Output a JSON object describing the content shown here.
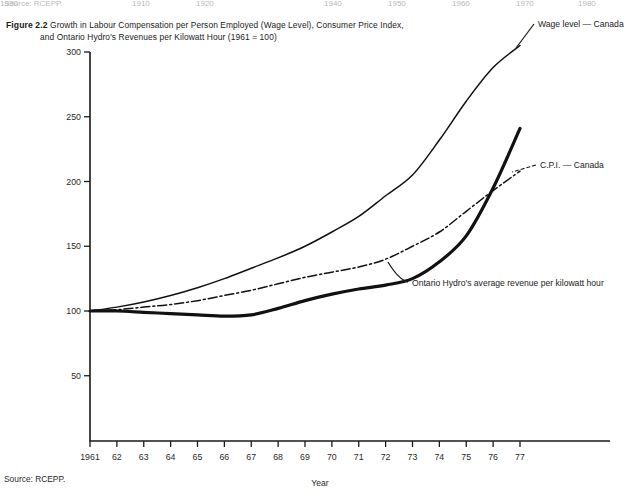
{
  "page": {
    "top_remnant": {
      "source": "Source: RCEPP.",
      "years": [
        "1910",
        "1920",
        "1930",
        "1940",
        "1950",
        "1960",
        "1970",
        "1980"
      ]
    },
    "caption": {
      "figure_number": "Figure 2.2",
      "line1": "Growth in Labour Compensation per Person Employed (Wage Level), Consumer Price Index,",
      "line2": "and Ontario Hydro's Revenues per Kilowatt Hour (1961 = 100)"
    },
    "source_note": "Source: RCEPP."
  },
  "chart_data": {
    "type": "line",
    "title": "Growth in Labour Compensation per Person Employed (Wage Level), Consumer Price Index, and Ontario Hydro's Revenues per Kilowatt Hour (1961 = 100)",
    "xlabel": "Year",
    "ylabel": "",
    "xlim": [
      1961,
      1977
    ],
    "ylim": [
      0,
      300
    ],
    "grid": false,
    "legend_position": "inline-annotations",
    "x": [
      1961,
      1962,
      1963,
      1964,
      1965,
      1966,
      1967,
      1968,
      1969,
      1970,
      1971,
      1972,
      1973,
      1974,
      1975,
      1976,
      1977
    ],
    "categories": [
      "1961",
      "62",
      "63",
      "64",
      "65",
      "66",
      "67",
      "68",
      "69",
      "70",
      "71",
      "72",
      "73",
      "74",
      "75",
      "76",
      "77"
    ],
    "ytick_labels": [
      "50",
      "100",
      "150",
      "200",
      "250",
      "300"
    ],
    "ytick_values": [
      50,
      100,
      150,
      200,
      250,
      300
    ],
    "series": [
      {
        "name": "Wage level — Canada",
        "label": "Wage level — Canada",
        "style": "thin-solid",
        "color": "#111111",
        "values": [
          100,
          103,
          107,
          112,
          118,
          125,
          133,
          141,
          150,
          161,
          173,
          189,
          205,
          232,
          262,
          288,
          305
        ]
      },
      {
        "name": "C.P.I. — Canada",
        "label": "C.P.I. — Canada",
        "style": "dash-dot",
        "color": "#111111",
        "values": [
          100,
          101,
          103,
          105,
          108,
          112,
          116,
          121,
          126,
          130,
          134,
          140,
          150,
          161,
          177,
          193,
          208
        ]
      },
      {
        "name": "Ontario Hydro's average revenue per kilowatt hour",
        "label": "Ontario Hydro's average revenue per kilowatt hour",
        "style": "thick-solid",
        "color": "#111111",
        "values": [
          100,
          100,
          99,
          98,
          97,
          96,
          97,
          102,
          108,
          113,
          117,
          120,
          125,
          138,
          158,
          195,
          241
        ]
      }
    ],
    "annotations": [
      {
        "text": "Wage level — Canada",
        "x": 1977,
        "y": 305
      },
      {
        "text": "C.P.I. — Canada",
        "x": 1977,
        "y": 208
      },
      {
        "text": "Ontario Hydro's average revenue per kilowatt hour",
        "x": 1972,
        "y": 122
      }
    ]
  }
}
